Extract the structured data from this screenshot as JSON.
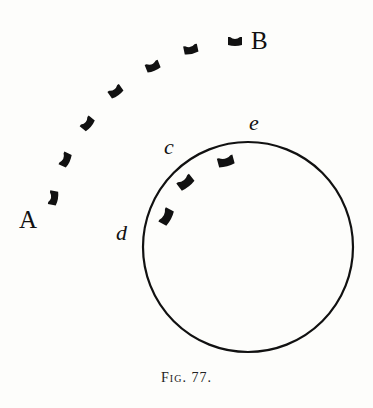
{
  "figure": {
    "caption": "Fig. 77.",
    "colors": {
      "ink": "#111111",
      "paper": "#fdfdfb"
    },
    "labels": {
      "A": "A",
      "B": "B",
      "c": "c",
      "d": "d",
      "e": "e"
    },
    "circle": {
      "cx": 248,
      "cy": 247,
      "r": 105
    },
    "outer_arc_marks": [
      {
        "x": 54,
        "y": 198,
        "angle": -80
      },
      {
        "x": 66,
        "y": 160,
        "angle": -65
      },
      {
        "x": 88,
        "y": 124,
        "angle": -50
      },
      {
        "x": 116,
        "y": 92,
        "angle": -35
      },
      {
        "x": 153,
        "y": 67,
        "angle": -22
      },
      {
        "x": 191,
        "y": 50,
        "angle": -12
      },
      {
        "x": 235,
        "y": 42,
        "angle": 0
      }
    ],
    "inner_arc_marks": [
      {
        "x": 167,
        "y": 217,
        "angle": -62
      },
      {
        "x": 186,
        "y": 183,
        "angle": -38
      },
      {
        "x": 226,
        "y": 162,
        "angle": -15
      }
    ]
  }
}
